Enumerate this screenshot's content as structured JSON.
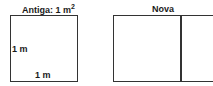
{
  "old_figure": {
    "title_prefix": "Antiga: 1 m",
    "title_exponent": "2",
    "side_label_left": "1 m",
    "side_label_bottom": "1 m"
  },
  "new_figure": {
    "title": "Nova"
  }
}
